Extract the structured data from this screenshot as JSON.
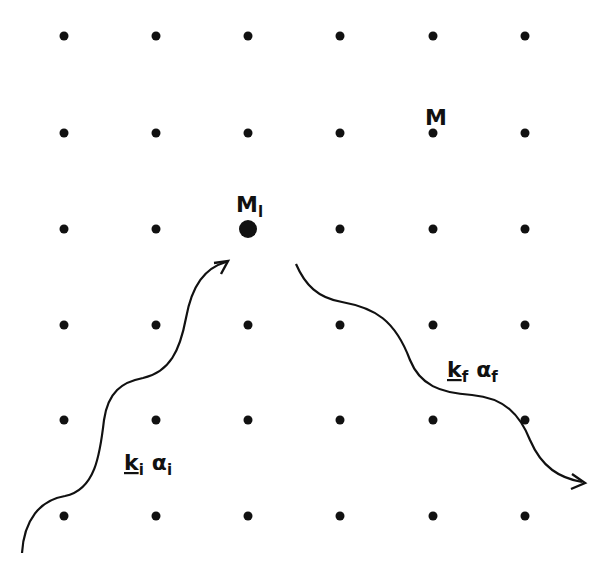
{
  "diagram": {
    "type": "lattice-scattering",
    "colors": {
      "ink": "#111111",
      "background": "#ffffff"
    },
    "lattice": {
      "columns_x": [
        64,
        156,
        248,
        340,
        433,
        525
      ],
      "rows_y": [
        36,
        133,
        229,
        325,
        420,
        516
      ],
      "dot_radius": 4.5,
      "highlighted_site": {
        "col": 2,
        "row": 2,
        "radius": 9
      }
    },
    "labels": {
      "generic_site": {
        "text": "M",
        "x": 425,
        "y": 125
      },
      "scattering_site": {
        "main": "M",
        "subscript": "l",
        "x": 236,
        "y": 212
      },
      "incident_wave": {
        "k": "k",
        "k_sub": "i",
        "alpha": "α",
        "alpha_sub": "i",
        "x": 124,
        "y": 470
      },
      "outgoing_wave": {
        "k": "k",
        "k_sub": "f",
        "alpha": "α",
        "alpha_sub": "f",
        "x": 447,
        "y": 377
      }
    },
    "waves": {
      "incident_path": "M 22 553 C 24 520, 40 500, 65 496 C 95 490, 100 455, 104 420 C 108 392, 122 382, 143 378 C 170 372, 180 350, 186 318 C 192 285, 205 268, 226 262",
      "incident_arrowhead": "M 214 263 L 228 261 L 221 274",
      "outgoing_path": "M 296 264 C 305 285, 318 298, 342 302 C 375 308, 395 320, 410 360 C 420 385, 440 393, 472 395 C 505 398, 520 415, 530 440 C 542 468, 560 478, 582 482",
      "outgoing_arrowhead": "M 572 474 L 585 483 L 571 489"
    }
  }
}
